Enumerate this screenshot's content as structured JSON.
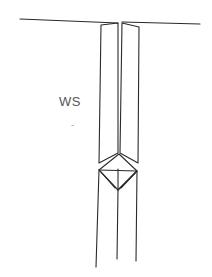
{
  "diagram": {
    "labels": {
      "ws": "WS",
      "mark": "-"
    },
    "colors": {
      "stroke": "#2a2a2a",
      "label": "#555555",
      "background": "#ffffff"
    }
  }
}
